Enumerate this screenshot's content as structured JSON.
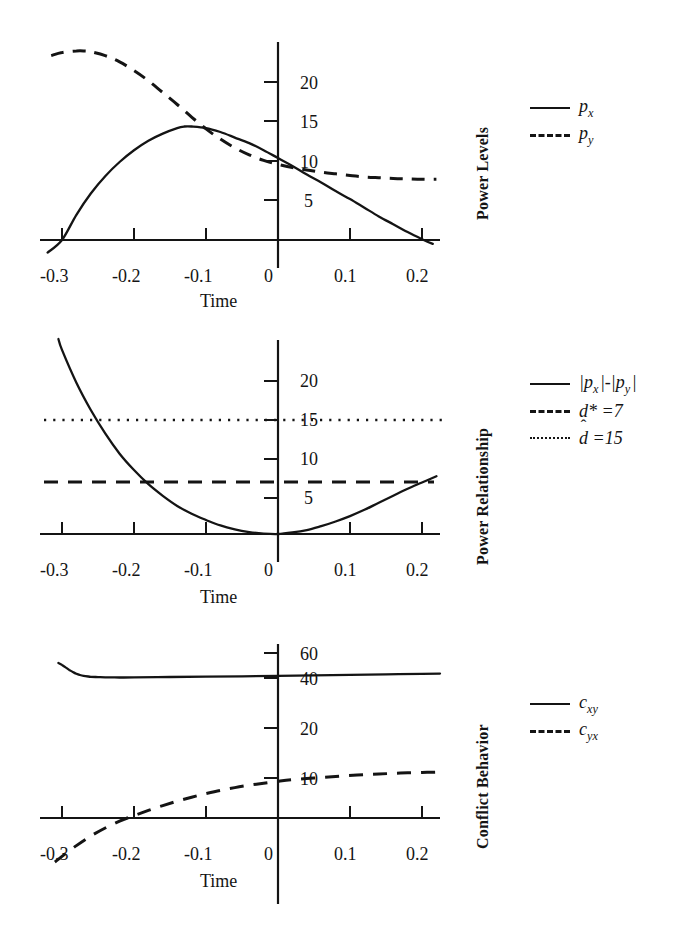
{
  "figure": {
    "panel_count": 3,
    "ink_color": "#141414",
    "background": "#ffffff"
  },
  "panels": [
    {
      "id": "power-levels",
      "axis_title": "Power Levels",
      "xlabel": "Time",
      "xticks": [
        "-0.3",
        "-0.2",
        "-0.1",
        "0",
        "0.1",
        "0.2"
      ],
      "yticks": [
        "5",
        "10",
        "15",
        "20"
      ],
      "legend": [
        {
          "style": "solid",
          "base": "p",
          "sub": "x",
          "label": "px"
        },
        {
          "style": "dashed",
          "base": "p",
          "sub": "y",
          "label": "py"
        }
      ]
    },
    {
      "id": "power-relationship",
      "axis_title": "Power Relationship",
      "xlabel": "Time",
      "xticks": [
        "-0.3",
        "-0.2",
        "-0.1",
        "0",
        "0.1",
        "0.2"
      ],
      "yticks": [
        "5",
        "10",
        "15",
        "20"
      ],
      "legend": [
        {
          "style": "solid",
          "label": "|px|-|py|"
        },
        {
          "style": "dashed",
          "label": "d* =7"
        },
        {
          "style": "dotted",
          "label": "d̂ =15"
        }
      ]
    },
    {
      "id": "conflict-behavior",
      "axis_title": "Conflict Behavior",
      "xlabel": "Time",
      "xticks": [
        "-0.3",
        "-0.2",
        "-0.1",
        "0",
        "0.1",
        "0.2"
      ],
      "yticks": [
        "10",
        "20",
        "40",
        "60"
      ],
      "legend": [
        {
          "style": "solid",
          "base": "c",
          "sub": "xy",
          "label": "cxy"
        },
        {
          "style": "dashed",
          "base": "c",
          "sub": "yx",
          "label": "cyx"
        }
      ]
    }
  ],
  "chart_data": [
    {
      "type": "line",
      "title": "Power Levels",
      "xlabel": "Time",
      "ylabel": "Power Levels",
      "xlim": [
        -0.32,
        0.235
      ],
      "ylim": [
        0,
        25
      ],
      "xticks": [
        -0.3,
        -0.2,
        -0.1,
        0,
        0.1,
        0.2
      ],
      "yticks": [
        5,
        10,
        15,
        20
      ],
      "grid": false,
      "legend_position": "right",
      "series": [
        {
          "name": "p_x",
          "style": "solid",
          "x": [
            -0.32,
            -0.3,
            -0.28,
            -0.26,
            -0.24,
            -0.22,
            -0.2,
            -0.18,
            -0.16,
            -0.14,
            -0.13,
            -0.12,
            -0.1,
            -0.08,
            -0.06,
            -0.04,
            -0.02,
            0.0,
            0.02,
            0.04,
            0.06,
            0.08,
            0.1,
            0.12,
            0.14,
            0.16,
            0.18,
            0.2,
            0.215
          ],
          "y": [
            -1.6,
            0.0,
            3.2,
            5.9,
            8.1,
            9.9,
            11.4,
            12.6,
            13.5,
            14.2,
            14.4,
            14.4,
            14.2,
            13.7,
            13.0,
            12.3,
            11.4,
            10.4,
            9.4,
            8.3,
            7.3,
            6.2,
            5.2,
            4.1,
            3.0,
            2.0,
            1.0,
            0.1,
            -0.5
          ]
        },
        {
          "name": "p_y",
          "style": "dashed",
          "x": [
            -0.315,
            -0.3,
            -0.28,
            -0.27,
            -0.26,
            -0.24,
            -0.22,
            -0.2,
            -0.18,
            -0.16,
            -0.14,
            -0.12,
            -0.1,
            -0.08,
            -0.06,
            -0.04,
            -0.02,
            0.0,
            0.02,
            0.04,
            0.06,
            0.08,
            0.1,
            0.12,
            0.14,
            0.16,
            0.18,
            0.2,
            0.22
          ],
          "y": [
            23.4,
            23.8,
            24.0,
            24.0,
            23.9,
            23.4,
            22.6,
            21.5,
            20.2,
            18.7,
            17.2,
            15.6,
            14.1,
            12.8,
            11.7,
            10.8,
            10.1,
            9.6,
            9.2,
            8.9,
            8.6,
            8.4,
            8.2,
            8.0,
            7.9,
            7.8,
            7.75,
            7.7,
            7.7
          ]
        }
      ]
    },
    {
      "type": "line",
      "title": "Power Relationship",
      "xlabel": "Time",
      "ylabel": "Power Relationship",
      "xlim": [
        -0.32,
        0.235
      ],
      "ylim": [
        0,
        25
      ],
      "xticks": [
        -0.3,
        -0.2,
        -0.1,
        0,
        0.1,
        0.2
      ],
      "yticks": [
        5,
        10,
        15,
        20
      ],
      "grid": false,
      "legend_position": "right",
      "series": [
        {
          "name": "|p_x|-|p_y|",
          "style": "solid",
          "x": [
            -0.305,
            -0.3,
            -0.28,
            -0.26,
            -0.24,
            -0.22,
            -0.2,
            -0.18,
            -0.16,
            -0.14,
            -0.12,
            -0.1,
            -0.08,
            -0.06,
            -0.04,
            -0.02,
            0.0,
            0.02,
            0.04,
            0.06,
            0.08,
            0.1,
            0.12,
            0.14,
            0.16,
            0.18,
            0.2,
            0.22
          ],
          "y": [
            25.0,
            23.6,
            19.4,
            15.9,
            12.9,
            10.3,
            8.2,
            6.4,
            4.9,
            3.6,
            2.6,
            1.8,
            1.1,
            0.6,
            0.25,
            0.05,
            0.0,
            0.2,
            0.5,
            1.0,
            1.6,
            2.3,
            3.1,
            4.0,
            4.9,
            5.8,
            6.6,
            7.4
          ]
        },
        {
          "name": "d* =7",
          "style": "dashed",
          "constant": 7,
          "x": [
            -0.305,
            0.225
          ],
          "y": [
            7,
            7
          ]
        },
        {
          "name": "d-hat =15",
          "style": "dotted",
          "constant": 15,
          "x": [
            -0.305,
            0.235
          ],
          "y": [
            15,
            15
          ]
        }
      ]
    },
    {
      "type": "line",
      "title": "Conflict Behavior",
      "xlabel": "Time",
      "ylabel": "Conflict Behavior",
      "xlim": [
        -0.32,
        0.235
      ],
      "ylim": [
        -12,
        68
      ],
      "xticks": [
        -0.3,
        -0.2,
        -0.1,
        0,
        0.1,
        0.2
      ],
      "yticks": [
        10,
        20,
        40,
        60
      ],
      "grid": false,
      "legend_position": "right",
      "series": [
        {
          "name": "c_xy",
          "style": "solid",
          "x": [
            -0.305,
            -0.3,
            -0.295,
            -0.29,
            -0.285,
            -0.28,
            -0.275,
            -0.27,
            -0.26,
            -0.25,
            -0.24,
            -0.22,
            -0.2,
            -0.15,
            -0.1,
            -0.05,
            0.0,
            0.05,
            0.1,
            0.15,
            0.2,
            0.225
          ],
          "y": [
            52.0,
            50.5,
            48.5,
            46.5,
            44.8,
            43.4,
            42.4,
            41.7,
            41.0,
            40.7,
            40.5,
            40.4,
            40.5,
            40.8,
            41.1,
            41.4,
            41.7,
            42.1,
            42.5,
            42.9,
            43.3,
            43.5
          ]
        },
        {
          "name": "c_yx",
          "style": "dashed",
          "x": [
            -0.31,
            -0.3,
            -0.28,
            -0.26,
            -0.24,
            -0.22,
            -0.2,
            -0.18,
            -0.16,
            -0.14,
            -0.12,
            -0.1,
            -0.08,
            -0.06,
            -0.04,
            -0.02,
            0.0,
            0.02,
            0.05,
            0.08,
            0.11,
            0.14,
            0.17,
            0.2,
            0.225
          ],
          "y": [
            -11.0,
            -9.6,
            -6.9,
            -4.5,
            -2.5,
            -0.8,
            0.6,
            1.9,
            3.1,
            4.2,
            5.2,
            6.1,
            6.9,
            7.6,
            8.2,
            8.7,
            9.2,
            9.6,
            10.0,
            10.3,
            10.6,
            10.8,
            11.0,
            11.1,
            11.2
          ]
        }
      ]
    }
  ]
}
